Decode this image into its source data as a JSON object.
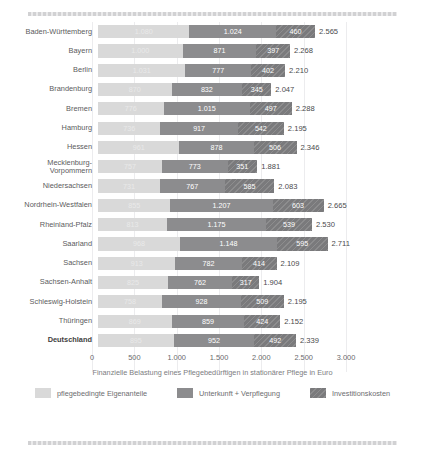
{
  "chart_data": {
    "type": "bar",
    "orientation": "horizontal",
    "stacked": true,
    "title": "",
    "xlabel": "Finanzielle Belastung eines Pflegebedürftigen in stationärer Pflege in Euro",
    "ylabel": "",
    "xlim": [
      0,
      3000
    ],
    "xticks": [
      0,
      500,
      1000,
      1500,
      2000,
      2500,
      3000
    ],
    "xticklabels": [
      "0",
      "500",
      "1.000",
      "1.500",
      "2.000",
      "2.500",
      "3.000"
    ],
    "grid": true,
    "legend_position": "bottom",
    "series": [
      {
        "name": "pflegebedingte Eigenanteile",
        "color": "#d9d9d9",
        "values": [
          1080,
          1000,
          1031,
          870,
          776,
          736,
          961,
          757,
          731,
          855,
          813,
          968,
          913,
          825,
          758,
          869,
          895
        ]
      },
      {
        "name": "Unterkunft + Verpflegung",
        "color": "#8c8c8e",
        "values": [
          1024,
          871,
          777,
          832,
          1015,
          917,
          878,
          773,
          767,
          1207,
          1175,
          1148,
          782,
          762,
          928,
          859,
          952
        ]
      },
      {
        "name": "Investitionskosten",
        "color": "#7a7a7c",
        "values": [
          460,
          397,
          402,
          345,
          497,
          542,
          506,
          351,
          585,
          603,
          539,
          595,
          414,
          317,
          509,
          424,
          492
        ]
      }
    ],
    "categories": [
      "Baden-Württemberg",
      "Bayern",
      "Berlin",
      "Brandenburg",
      "Bremen",
      "Hamburg",
      "Hessen",
      "Mecklenburg-\nVorpommern",
      "Niedersachsen",
      "Nordrhein-Westfalen",
      "Rheinland-Pfalz",
      "Saarland",
      "Sachsen",
      "Sachsen-Anhalt",
      "Schleswig-Holstein",
      "Thüringen",
      "Deutschland"
    ],
    "totals": [
      2565,
      2268,
      2210,
      2047,
      2288,
      2195,
      2346,
      1881,
      2083,
      2665,
      2530,
      2711,
      2109,
      1904,
      2195,
      2152,
      2339
    ],
    "total_labels": [
      "2.565",
      "2.268",
      "2.210",
      "2.047",
      "2.288",
      "2.195",
      "2.346",
      "1.881",
      "2.083",
      "2.665",
      "2.530",
      "2.711",
      "2.109",
      "1.904",
      "2.195",
      "2.152",
      "2.339"
    ],
    "segment_labels": [
      [
        "1.080",
        "1.024",
        "460"
      ],
      [
        "1.000",
        "871",
        "397"
      ],
      [
        "1.031",
        "777",
        "402"
      ],
      [
        "870",
        "832",
        "345"
      ],
      [
        "776",
        "1.015",
        "497"
      ],
      [
        "736",
        "917",
        "542"
      ],
      [
        "961",
        "878",
        "506"
      ],
      [
        "757",
        "773",
        "351"
      ],
      [
        "731",
        "767",
        "585"
      ],
      [
        "855",
        "1.207",
        "603"
      ],
      [
        "813",
        "1.175",
        "539"
      ],
      [
        "968",
        "1.148",
        "595"
      ],
      [
        "913",
        "782",
        "414"
      ],
      [
        "825",
        "762",
        "317"
      ],
      [
        "758",
        "928",
        "509"
      ],
      [
        "869",
        "859",
        "424"
      ],
      [
        "895",
        "952",
        "492"
      ]
    ],
    "highlight_row": "Deutschland"
  }
}
